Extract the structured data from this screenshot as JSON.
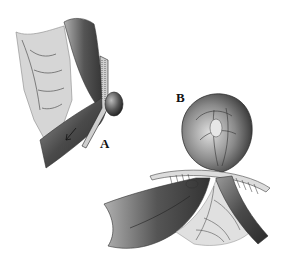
{
  "figure": {
    "labels": {
      "a": "A",
      "b": "B"
    },
    "colors": {
      "background": "#ffffff",
      "dark_tissue": "#3a3a3a",
      "mid_tissue": "#7a7a7a",
      "light_membrane": "#d8d8d8",
      "vessel": "#444444"
    }
  }
}
